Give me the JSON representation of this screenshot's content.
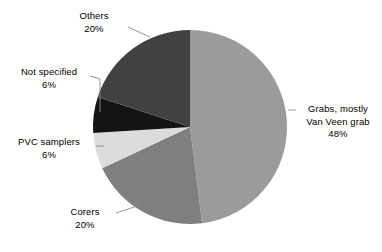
{
  "chart_data": {
    "type": "pie",
    "title": "",
    "subtitle": "",
    "xlabel": "",
    "ylabel": "",
    "legend_position": "none",
    "grid": false,
    "labels_outside": true,
    "value_suffix": "%",
    "categories": [
      "Grabs, mostly Van Veen grab",
      "Corers",
      "PVC samplers",
      "Not specified",
      "Others"
    ],
    "values": [
      48,
      20,
      6,
      6,
      20
    ],
    "colors": [
      "#9b9b9b",
      "#7f7f7f",
      "#dcdcdc",
      "#141414",
      "#414141"
    ],
    "slices": [
      {
        "id": "grabs",
        "name": "Grabs, mostly Van Veen grab",
        "label_lines": [
          "Grabs, mostly",
          "Van Veen grab"
        ],
        "value": 48,
        "value_text": "48%",
        "color": "#9b9b9b",
        "start_angle_deg": 0,
        "end_angle_deg": 172.8
      },
      {
        "id": "corers",
        "name": "Corers",
        "label_lines": [
          "Corers"
        ],
        "value": 20,
        "value_text": "20%",
        "color": "#7f7f7f",
        "start_angle_deg": 172.8,
        "end_angle_deg": 244.8
      },
      {
        "id": "pvc-samplers",
        "name": "PVC samplers",
        "label_lines": [
          "PVC samplers"
        ],
        "value": 6,
        "value_text": "6%",
        "color": "#dcdcdc",
        "start_angle_deg": 244.8,
        "end_angle_deg": 266.4
      },
      {
        "id": "not-specified",
        "name": "Not specified",
        "label_lines": [
          "Not specified"
        ],
        "value": 6,
        "value_text": "6%",
        "color": "#141414",
        "start_angle_deg": 266.4,
        "end_angle_deg": 288.0
      },
      {
        "id": "others",
        "name": "Others",
        "label_lines": [
          "Others"
        ],
        "value": 20,
        "value_text": "20%",
        "color": "#414141",
        "start_angle_deg": 288.0,
        "end_angle_deg": 360.0
      }
    ]
  },
  "labels": {
    "others": {
      "name": "Others",
      "value_text": "20%"
    },
    "not_specified": {
      "name": "Not specified",
      "value_text": "6%"
    },
    "pvc_samplers": {
      "name": "PVC samplers",
      "value_text": "6%"
    },
    "corers": {
      "name": "Corers",
      "value_text": "20%"
    },
    "grabs": {
      "line1": "Grabs, mostly",
      "line2": "Van Veen grab",
      "value_text": "48%"
    }
  }
}
